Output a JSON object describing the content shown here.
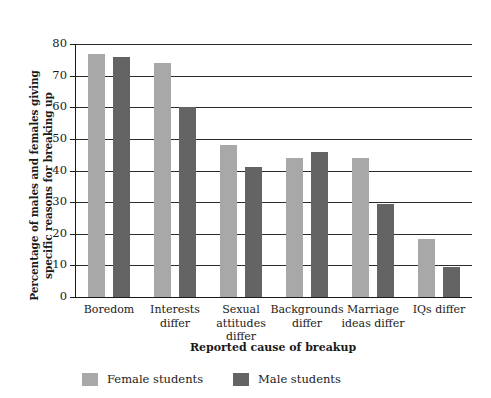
{
  "chart_data": {
    "type": "bar",
    "title": "",
    "xlabel": "Reported cause of breakup",
    "ylabel": "Percentage of males and females giving\nspecific reasons for breaking up",
    "ylim": [
      0,
      80
    ],
    "yticks": [
      0,
      10,
      20,
      30,
      40,
      50,
      60,
      70,
      80
    ],
    "ytick_labels": [
      "0",
      "10",
      "20",
      "30",
      "40",
      "50",
      "60",
      "70",
      "80"
    ],
    "grid": true,
    "legend_position": "bottom-left",
    "categories": [
      "Boredom",
      "Interests\ndiffer",
      "Sexual\nattitudes\ndiffer",
      "Backgrounds\ndiffer",
      "Marriage\nideas differ",
      "IQs differ"
    ],
    "series": [
      {
        "name": "Female students",
        "color": "#a8a8a8",
        "values": [
          77,
          74,
          48,
          44,
          44,
          18.5
        ]
      },
      {
        "name": "Male students",
        "color": "#646464",
        "values": [
          76,
          60,
          41,
          46,
          29.5,
          9.5
        ]
      }
    ]
  },
  "legend": {
    "items": [
      {
        "label": "Female students",
        "swatch": "female"
      },
      {
        "label": "Male students",
        "swatch": "male"
      }
    ]
  }
}
